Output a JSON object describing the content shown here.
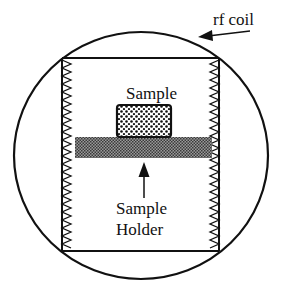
{
  "diagram": {
    "labels": {
      "rf_coil": "rf coil",
      "sample": "Sample",
      "holder_line1": "Sample",
      "holder_line2": "Holder"
    },
    "components": [
      {
        "id": "rf-coil",
        "shape": "circle"
      },
      {
        "id": "coil-frame",
        "shape": "rectangle",
        "sides": "zigzag"
      },
      {
        "id": "sample",
        "shape": "rounded-rectangle",
        "fill": "dotted"
      },
      {
        "id": "sample-holder",
        "shape": "bar",
        "fill": "cross-hatched"
      }
    ],
    "colors": {
      "stroke": "#111111",
      "holder": "#6a6a6a",
      "background": "#ffffff"
    }
  }
}
